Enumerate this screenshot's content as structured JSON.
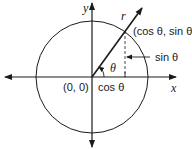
{
  "diagram": {
    "type": "unit-circle",
    "axes": {
      "x_label": "x",
      "y_label": "y"
    },
    "origin_label": "(0, 0)",
    "radius_label": "r",
    "point_label": "(cos θ, sin θ)",
    "angle_label": "θ",
    "adjacent_label": "cos θ",
    "opposite_label": "sin θ",
    "colors": {
      "stroke": "#1a1a1a",
      "background": "#ffffff"
    }
  }
}
